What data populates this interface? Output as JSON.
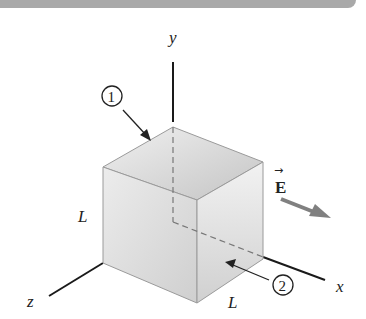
{
  "figure": {
    "axes": {
      "x_label": "x",
      "y_label": "y",
      "z_label": "z"
    },
    "cube": {
      "side_label_left": "L",
      "side_label_bottom": "L",
      "face_markers": [
        {
          "id": "1",
          "label": "1",
          "face": "top"
        },
        {
          "id": "2",
          "label": "2",
          "face": "right"
        }
      ]
    },
    "field": {
      "label": "E",
      "vector_arrow": "→",
      "arrow_color": "#808080"
    },
    "colors": {
      "header_bar": "#a9a9a9",
      "cube_face_front": "#e2e2e2",
      "cube_face_top": "#cfcfcf",
      "cube_face_right": "#d8d8d8",
      "axis": "#1a1a1a"
    }
  }
}
